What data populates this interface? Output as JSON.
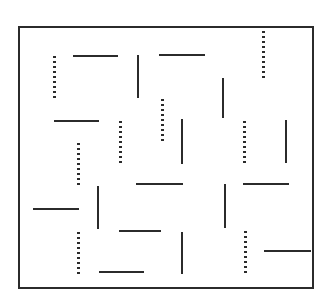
{
  "figure": {
    "background_color": "#ffffff",
    "ink_color": "#2b2b2b",
    "canvas": {
      "width": 330,
      "height": 302
    },
    "frame": {
      "x": 18,
      "y": 26,
      "width": 296,
      "height": 263,
      "border_width": 2,
      "border_color": "#2b2b2b"
    },
    "counts": {
      "solid_segments": 18,
      "dotted_segments": 10,
      "total_segments": 28
    },
    "elements": [
      {
        "id": "dotted-01",
        "style": "dotted",
        "orientation": "vertical",
        "x": 262,
        "y": 31,
        "length": 47
      },
      {
        "id": "solid-02",
        "style": "solid",
        "orientation": "horizontal",
        "x": 73,
        "y": 55,
        "length": 45
      },
      {
        "id": "solid-03",
        "style": "solid",
        "orientation": "horizontal",
        "x": 159,
        "y": 54,
        "length": 46
      },
      {
        "id": "dotted-04",
        "style": "dotted",
        "orientation": "vertical",
        "x": 53,
        "y": 56,
        "length": 45
      },
      {
        "id": "solid-05",
        "style": "solid",
        "orientation": "vertical",
        "x": 137,
        "y": 55,
        "length": 43
      },
      {
        "id": "solid-06",
        "style": "solid",
        "orientation": "vertical",
        "x": 222,
        "y": 78,
        "length": 40
      },
      {
        "id": "dotted-07",
        "style": "dotted",
        "orientation": "vertical",
        "x": 161,
        "y": 99,
        "length": 45
      },
      {
        "id": "solid-08",
        "style": "solid",
        "orientation": "horizontal",
        "x": 54,
        "y": 120,
        "length": 45
      },
      {
        "id": "dotted-09",
        "style": "dotted",
        "orientation": "vertical",
        "x": 119,
        "y": 121,
        "length": 43
      },
      {
        "id": "dotted-10",
        "style": "dotted",
        "orientation": "vertical",
        "x": 243,
        "y": 121,
        "length": 43
      },
      {
        "id": "solid-11",
        "style": "solid",
        "orientation": "vertical",
        "x": 181,
        "y": 119,
        "length": 45
      },
      {
        "id": "solid-12",
        "style": "solid",
        "orientation": "vertical",
        "x": 285,
        "y": 120,
        "length": 43
      },
      {
        "id": "dotted-13",
        "style": "dotted",
        "orientation": "vertical",
        "x": 77,
        "y": 143,
        "length": 45
      },
      {
        "id": "solid-14",
        "style": "solid",
        "orientation": "horizontal",
        "x": 136,
        "y": 183,
        "length": 47
      },
      {
        "id": "solid-15",
        "style": "solid",
        "orientation": "horizontal",
        "x": 243,
        "y": 183,
        "length": 46
      },
      {
        "id": "solid-16",
        "style": "solid",
        "orientation": "vertical",
        "x": 97,
        "y": 186,
        "length": 43
      },
      {
        "id": "solid-17",
        "style": "solid",
        "orientation": "vertical",
        "x": 224,
        "y": 184,
        "length": 44
      },
      {
        "id": "solid-18",
        "style": "solid",
        "orientation": "horizontal",
        "x": 33,
        "y": 208,
        "length": 46
      },
      {
        "id": "solid-19",
        "style": "solid",
        "orientation": "horizontal",
        "x": 119,
        "y": 230,
        "length": 42
      },
      {
        "id": "dotted-20",
        "style": "dotted",
        "orientation": "vertical",
        "x": 77,
        "y": 232,
        "length": 45
      },
      {
        "id": "dotted-21",
        "style": "dotted",
        "orientation": "vertical",
        "x": 244,
        "y": 231,
        "length": 43
      },
      {
        "id": "solid-22",
        "style": "solid",
        "orientation": "vertical",
        "x": 181,
        "y": 232,
        "length": 42
      },
      {
        "id": "solid-23",
        "style": "solid",
        "orientation": "horizontal",
        "x": 264,
        "y": 250,
        "length": 47
      },
      {
        "id": "solid-24",
        "style": "solid",
        "orientation": "horizontal",
        "x": 99,
        "y": 271,
        "length": 45
      }
    ]
  }
}
